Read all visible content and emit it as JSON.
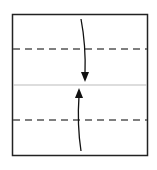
{
  "diagram": {
    "type": "origami-fold",
    "paper": {
      "x": 12,
      "y": 14,
      "width": 136,
      "height": 142,
      "stroke": "#222222"
    },
    "center_line": {
      "y": 85,
      "color": "#bbbbbb"
    },
    "valley_folds": [
      {
        "y": 49
      },
      {
        "y": 120
      }
    ],
    "arrows": [
      {
        "direction": "down",
        "from": "top-edge",
        "to": "center"
      },
      {
        "direction": "up",
        "from": "bottom-edge",
        "to": "center"
      }
    ]
  }
}
